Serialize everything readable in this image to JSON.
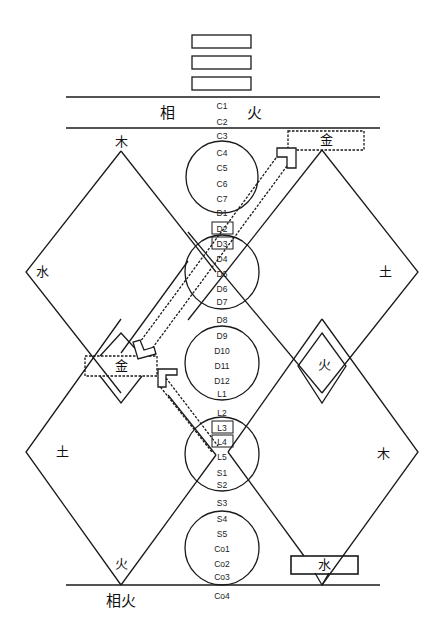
{
  "diagram": {
    "trigram_bars": 3,
    "header_band": {
      "left": "相",
      "right": "火"
    },
    "footer_label": "相火",
    "colors": {
      "stroke": "#1a1a1a",
      "background": "#ffffff"
    }
  },
  "spine_labels": [
    {
      "id": "C1",
      "y": 106
    },
    {
      "id": "C2",
      "y": 122
    },
    {
      "id": "C3",
      "y": 136
    },
    {
      "id": "C4",
      "y": 153
    },
    {
      "id": "C5",
      "y": 168
    },
    {
      "id": "C6",
      "y": 184
    },
    {
      "id": "C7",
      "y": 199
    },
    {
      "id": "D1",
      "y": 213
    },
    {
      "id": "D2",
      "y": 229,
      "boxed": true
    },
    {
      "id": "D3",
      "y": 244,
      "boxed": true
    },
    {
      "id": "D4",
      "y": 259
    },
    {
      "id": "D5",
      "y": 274
    },
    {
      "id": "D6",
      "y": 289
    },
    {
      "id": "D7",
      "y": 302
    },
    {
      "id": "D8",
      "y": 320
    },
    {
      "id": "D9",
      "y": 336
    },
    {
      "id": "D10",
      "y": 351
    },
    {
      "id": "D11",
      "y": 366
    },
    {
      "id": "D12",
      "y": 381
    },
    {
      "id": "L1",
      "y": 394
    },
    {
      "id": "L2",
      "y": 413
    },
    {
      "id": "L3",
      "y": 428,
      "boxed": true
    },
    {
      "id": "L4",
      "y": 442,
      "boxed": true
    },
    {
      "id": "L5",
      "y": 457
    },
    {
      "id": "S1",
      "y": 473
    },
    {
      "id": "S2",
      "y": 485
    },
    {
      "id": "S3",
      "y": 503
    },
    {
      "id": "S4",
      "y": 519
    },
    {
      "id": "S5",
      "y": 534
    },
    {
      "id": "Co1",
      "y": 549
    },
    {
      "id": "Co2",
      "y": 564
    },
    {
      "id": "Co3",
      "y": 577
    },
    {
      "id": "Co4",
      "y": 596
    }
  ],
  "elements": {
    "upper_left_top": "木",
    "upper_left_left": "水",
    "upper_right_top": "金",
    "upper_right_right": "土",
    "middle_left_box": "金",
    "middle_right_small": "火",
    "lower_left_left": "土",
    "lower_left_bottom": "火",
    "lower_right_right": "木",
    "lower_right_box": "水"
  }
}
